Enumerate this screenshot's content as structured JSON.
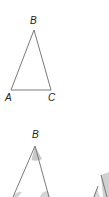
{
  "colors": {
    "line": "#7a7a7a",
    "shade": "#c8c8c8",
    "label": "#222222"
  },
  "top_triangle": {
    "labels": {
      "a": "A",
      "b": "B",
      "c": "C"
    },
    "vertices": {
      "A": [
        11,
        90
      ],
      "B": [
        34,
        30
      ],
      "C": [
        51,
        90
      ]
    }
  },
  "bottom_triangle": {
    "labels": {
      "b": "B"
    },
    "vertices": {
      "B": [
        35,
        146
      ]
    }
  },
  "cut_pieces_note": "Torn angle pieces partially visible at right edge"
}
